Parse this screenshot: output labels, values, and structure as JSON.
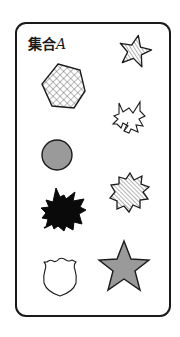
{
  "title": {
    "prefix": "集合",
    "variable": "A"
  },
  "colors": {
    "stroke": "#1a1a1a",
    "gray_fill": "#9a9a9a",
    "black_fill": "#0a0a0a",
    "white_fill": "#ffffff"
  },
  "elements": [
    {
      "shape": "star-5",
      "size": "small",
      "fill": "diagonal-hatch"
    },
    {
      "shape": "hexagon",
      "size": "large",
      "fill": "crosshatch"
    },
    {
      "shape": "maple-leaf",
      "size": "medium",
      "fill": "white"
    },
    {
      "shape": "circle",
      "size": "medium",
      "fill": "gray"
    },
    {
      "shape": "maple-leaf",
      "size": "large",
      "fill": "black"
    },
    {
      "shape": "star-burst-8",
      "size": "medium",
      "fill": "diagonal-hatch"
    },
    {
      "shape": "shield",
      "size": "medium",
      "fill": "white"
    },
    {
      "shape": "star-5",
      "size": "large",
      "fill": "gray"
    }
  ]
}
